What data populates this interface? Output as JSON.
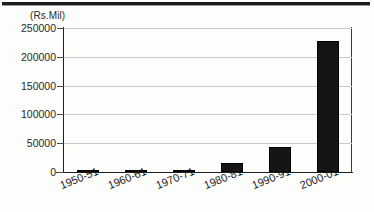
{
  "chart_data": {
    "type": "bar",
    "title": "",
    "subtitle": "",
    "unit_label": "(Rs.Mil)",
    "xlabel": "",
    "ylabel": "",
    "categories": [
      "1950-51",
      "1960-61",
      "1970-71",
      "1980-81",
      "1990-91",
      "2000-01"
    ],
    "values": [
      2000,
      2000,
      3000,
      15000,
      44000,
      227000
    ],
    "ylim": [
      0,
      250000
    ],
    "yticks": [
      0,
      50000,
      100000,
      150000,
      200000,
      250000
    ],
    "ytick_labels": [
      "0",
      "50000",
      "100000",
      "150000",
      "200000",
      "250000"
    ],
    "grid": true,
    "legend": "none",
    "series_color": "#141414",
    "gridline_color": "#c9c9c9",
    "axis_color": "#1f1f1f",
    "xtick_label_rotation_deg": -22
  }
}
